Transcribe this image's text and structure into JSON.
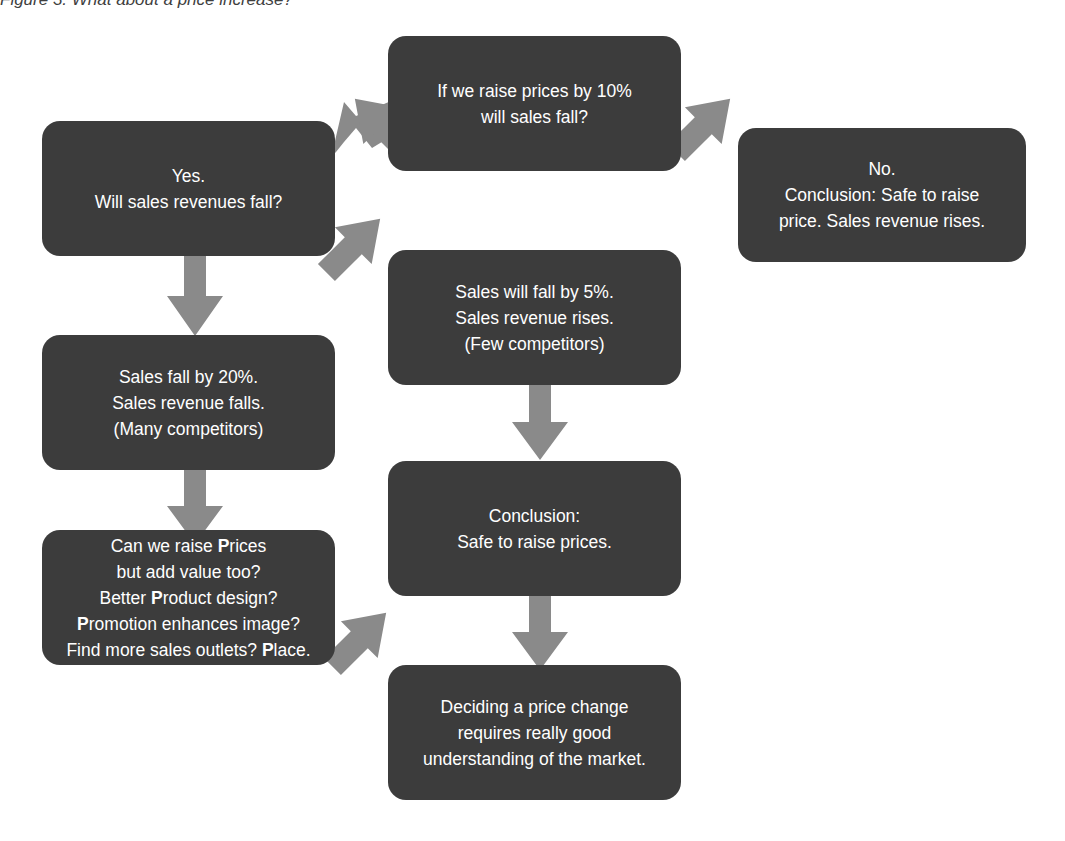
{
  "figure": {
    "caption": "Figure 3. What about a price increase?",
    "type": "flowchart",
    "colors": {
      "node_fill": "#3c3c3c",
      "node_text": "#ffffff",
      "arrow": "#8a8a8a",
      "background": "#ffffff",
      "caption_text": "#3f3f3f"
    }
  },
  "nodes": {
    "question_raise_prices": {
      "id": "question-raise-prices",
      "lines": [
        "If we raise prices by 10%",
        "will sales fall?"
      ],
      "role": "decision-question"
    },
    "yes_branch": {
      "id": "yes-will-revenues-fall",
      "lines": [
        "Yes.",
        "Will sales revenues fall?"
      ],
      "role": "branch-yes"
    },
    "no_branch": {
      "id": "no-safe-to-raise",
      "lines": [
        "No.",
        "Conclusion: Safe to raise",
        "price. Sales revenue rises."
      ],
      "role": "branch-no-conclusion"
    },
    "few_competitors": {
      "id": "sales-fall-5-percent",
      "lines": [
        "Sales will fall by 5%.",
        "Sales revenue rises.",
        "(Few competitors)"
      ],
      "role": "outcome-few-competitors"
    },
    "many_competitors": {
      "id": "sales-fall-20-percent",
      "lines": [
        "Sales fall by 20%.",
        "Sales revenue falls.",
        "(Many competitors)"
      ],
      "role": "outcome-many-competitors"
    },
    "conclusion_safe": {
      "id": "conclusion-safe-to-raise-prices",
      "lines": [
        "Conclusion:",
        "Safe to raise prices."
      ],
      "role": "conclusion"
    },
    "four_ps": {
      "id": "add-value-four-ps",
      "role": "question-marketing-mix",
      "lines_html": [
        "Can we raise <b>P</b>rices",
        "but add value too?",
        "Better <b>P</b>roduct design?",
        "<b>P</b>romotion enhances image?",
        "Find more sales outlets? <b>P</b>lace."
      ],
      "lines_plain": [
        "Can we raise Prices",
        "but add value too?",
        "Better Product design?",
        "Promotion enhances image?",
        "Find more sales outlets? Place."
      ]
    },
    "final_takeaway": {
      "id": "deciding-price-change",
      "lines": [
        "Deciding a price change",
        "requires really good",
        "understanding of the market."
      ],
      "role": "takeaway"
    }
  },
  "arrows": [
    {
      "name": "arrow-question-to-yes",
      "direction": "down-left"
    },
    {
      "name": "arrow-question-to-no",
      "direction": "down-right"
    },
    {
      "name": "arrow-yes-to-few-competitors",
      "direction": "down-right"
    },
    {
      "name": "arrow-yes-to-many-competitors",
      "direction": "down"
    },
    {
      "name": "arrow-few-competitors-to-conclusion",
      "direction": "down"
    },
    {
      "name": "arrow-many-competitors-to-four-ps",
      "direction": "down"
    },
    {
      "name": "arrow-conclusion-to-takeaway",
      "direction": "down"
    },
    {
      "name": "arrow-four-ps-to-takeaway",
      "direction": "down-right"
    }
  ]
}
